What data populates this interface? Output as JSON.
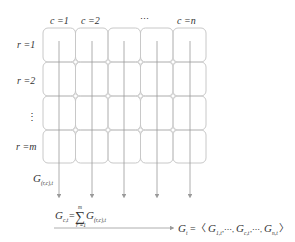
{
  "column_labels": [
    "c =1",
    "c =2",
    "⋯",
    "",
    "c =n"
  ],
  "row_labels": [
    "r =1",
    "r =2",
    "⋮",
    "r =m"
  ],
  "grid": {
    "columns": 5,
    "rows": 4,
    "stroke_color": "#c8c8c8"
  },
  "flow_label": {
    "base": "G",
    "sub": "(r,c),t"
  },
  "column_sum": {
    "lhs_base": "G",
    "lhs_sub": "c,t",
    "equals": "=",
    "sum_symbol": "∑",
    "sum_upper": "m",
    "sum_lower": "r =1",
    "term_base": "G",
    "term_sub": "(r,c),t"
  },
  "result_vector": {
    "lhs_base": "G",
    "lhs_sub": "t",
    "equals": "=",
    "open": "〈",
    "close": "〉",
    "items": [
      {
        "base": "G",
        "sub": "1,t"
      },
      {
        "sep": ",⋯,"
      },
      {
        "base": "G",
        "sub": "c,t"
      },
      {
        "sep": ",⋯,"
      },
      {
        "base": "G",
        "sub": "n,t"
      }
    ]
  },
  "colors": {
    "grid": "#c8c8c8",
    "arrow": "#9a9a9a",
    "text": "#333333"
  }
}
